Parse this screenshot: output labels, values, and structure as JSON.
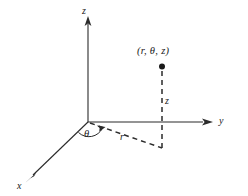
{
  "figure": {
    "background_color": "#ffffff",
    "line_color": "#2b2b2b",
    "labels": {
      "z_axis": "z",
      "y_axis": "y",
      "x_axis": "x",
      "point": "(r, θ, z)",
      "z_segment": "z",
      "r_segment": "r",
      "theta_angle": "θ"
    },
    "geometry": {
      "origin": [
        88,
        122
      ],
      "z_axis_tip": [
        88,
        18
      ],
      "y_axis_tip": [
        212,
        122
      ],
      "x_axis_tip": [
        26,
        181
      ],
      "point": [
        162,
        66
      ],
      "foot": [
        162,
        148
      ]
    }
  }
}
